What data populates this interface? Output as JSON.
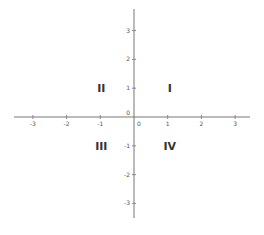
{
  "chart_data": {
    "type": "scatter",
    "title": "",
    "xlabel": "",
    "ylabel": "",
    "xlim": [
      -3.5,
      3.5
    ],
    "ylim": [
      -3.5,
      3.7
    ],
    "grid": false,
    "x_ticks": [
      -3,
      -2,
      -1,
      0,
      1,
      2,
      3
    ],
    "x_tick_labels": [
      "-3",
      "-2",
      "-1",
      "0",
      "1",
      "2",
      "3"
    ],
    "y_ticks": [
      3,
      2,
      1,
      0,
      -1,
      -2,
      -3
    ],
    "y_tick_labels": [
      "3",
      "2",
      "1",
      "0",
      "-1",
      "-2",
      "-3"
    ],
    "annotations": [
      {
        "text": "I",
        "x": 1,
        "y": 1
      },
      {
        "text": "II",
        "x": -1,
        "y": 1
      },
      {
        "text": "III",
        "x": -1,
        "y": -1
      },
      {
        "text": "IV",
        "x": 1,
        "y": -1
      }
    ]
  }
}
